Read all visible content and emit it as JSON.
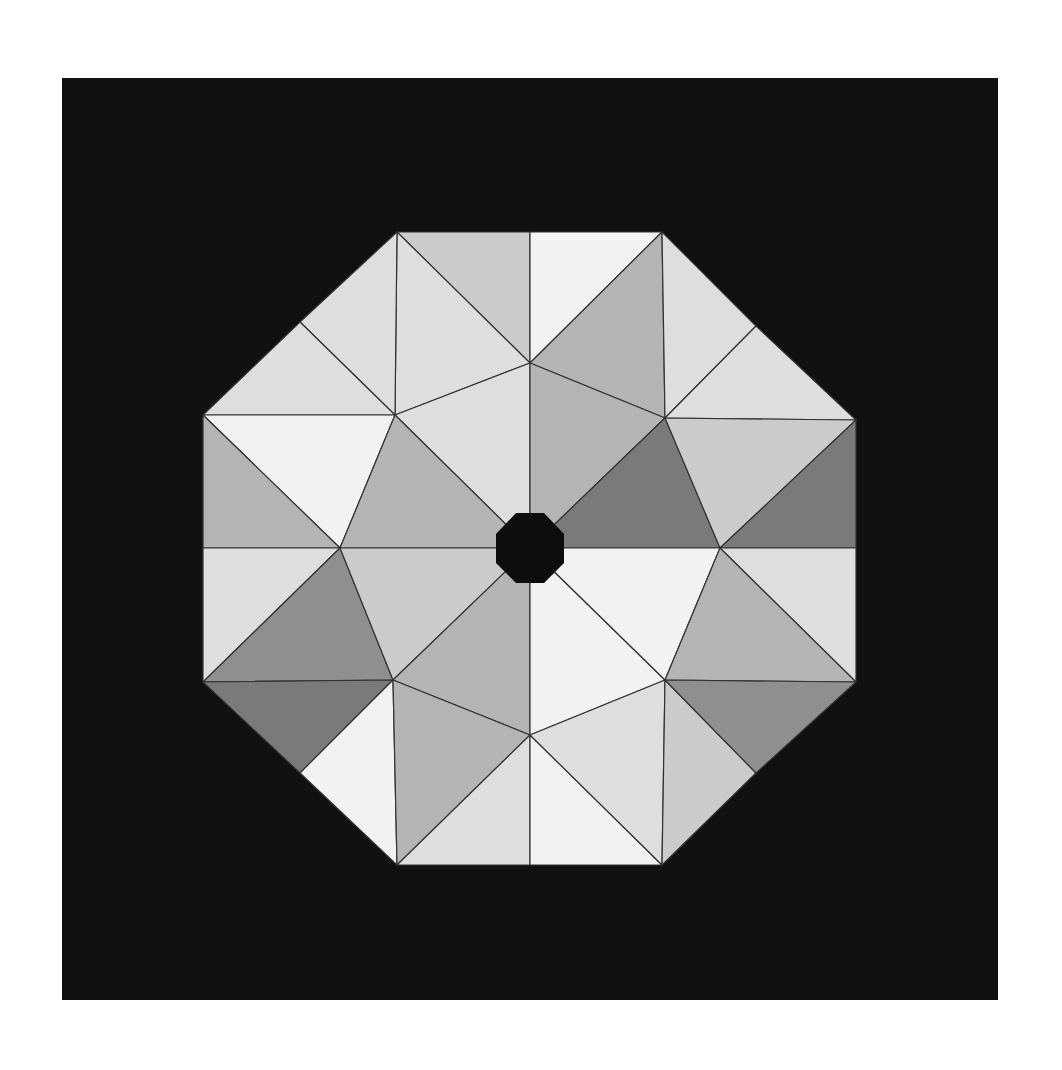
{
  "figure": {
    "title": "",
    "background": "#ffffff",
    "frame": {
      "x": 62,
      "y": 78,
      "width": 936,
      "height": 922,
      "color": "#111111"
    },
    "center": [
      530,
      548
    ],
    "center_hole": {
      "shape": "octagon",
      "color": "#0d0d0d",
      "points": [
        [
          516,
          513
        ],
        [
          544,
          513
        ],
        [
          564,
          534
        ],
        [
          564,
          563
        ],
        [
          544,
          583
        ],
        [
          516,
          583
        ],
        [
          496,
          563
        ],
        [
          496,
          534
        ]
      ]
    },
    "shades": {
      "lightest": "#f2f2f2",
      "light": "#dedede",
      "mid_light": "#cbcbcb",
      "mid": "#b4b4b4",
      "dark": "#8f8f8f",
      "darker": "#7a7a7a"
    },
    "triangles": [
      {
        "pts": [
          [
            397,
            232
          ],
          [
            530,
            232
          ],
          [
            530,
            363
          ]
        ],
        "shade": "mid_light"
      },
      {
        "pts": [
          [
            397,
            232
          ],
          [
            530,
            363
          ],
          [
            395,
            415
          ]
        ],
        "shade": "light"
      },
      {
        "pts": [
          [
            530,
            232
          ],
          [
            662,
            232
          ],
          [
            530,
            363
          ]
        ],
        "shade": "lightest"
      },
      {
        "pts": [
          [
            662,
            232
          ],
          [
            530,
            363
          ],
          [
            665,
            418
          ]
        ],
        "shade": "mid"
      },
      {
        "pts": [
          [
            662,
            232
          ],
          [
            756,
            326
          ],
          [
            665,
            418
          ]
        ],
        "shade": "light"
      },
      {
        "pts": [
          [
            756,
            326
          ],
          [
            856,
            420
          ],
          [
            665,
            418
          ]
        ],
        "shade": "light"
      },
      {
        "pts": [
          [
            397,
            232
          ],
          [
            300,
            322
          ],
          [
            395,
            415
          ]
        ],
        "shade": "light"
      },
      {
        "pts": [
          [
            300,
            322
          ],
          [
            203,
            415
          ],
          [
            395,
            415
          ]
        ],
        "shade": "light"
      },
      {
        "pts": [
          [
            203,
            415
          ],
          [
            395,
            415
          ],
          [
            340,
            548
          ]
        ],
        "shade": "lightest"
      },
      {
        "pts": [
          [
            203,
            415
          ],
          [
            340,
            548
          ],
          [
            203,
            548
          ]
        ],
        "shade": "mid"
      },
      {
        "pts": [
          [
            395,
            415
          ],
          [
            530,
            363
          ],
          [
            530,
            548
          ]
        ],
        "shade": "light"
      },
      {
        "pts": [
          [
            395,
            415
          ],
          [
            530,
            548
          ],
          [
            340,
            548
          ]
        ],
        "shade": "mid"
      },
      {
        "pts": [
          [
            530,
            363
          ],
          [
            665,
            418
          ],
          [
            530,
            548
          ]
        ],
        "shade": "mid"
      },
      {
        "pts": [
          [
            665,
            418
          ],
          [
            720,
            548
          ],
          [
            530,
            548
          ]
        ],
        "shade": "darker"
      },
      {
        "pts": [
          [
            665,
            418
          ],
          [
            856,
            420
          ],
          [
            720,
            548
          ]
        ],
        "shade": "mid_light"
      },
      {
        "pts": [
          [
            856,
            420
          ],
          [
            856,
            548
          ],
          [
            720,
            548
          ]
        ],
        "shade": "darker"
      },
      {
        "pts": [
          [
            203,
            548
          ],
          [
            340,
            548
          ],
          [
            203,
            682
          ]
        ],
        "shade": "light"
      },
      {
        "pts": [
          [
            340,
            548
          ],
          [
            393,
            680
          ],
          [
            203,
            682
          ]
        ],
        "shade": "dark"
      },
      {
        "pts": [
          [
            340,
            548
          ],
          [
            530,
            548
          ],
          [
            393,
            680
          ]
        ],
        "shade": "mid_light"
      },
      {
        "pts": [
          [
            530,
            548
          ],
          [
            530,
            735
          ],
          [
            393,
            680
          ]
        ],
        "shade": "mid"
      },
      {
        "pts": [
          [
            530,
            548
          ],
          [
            665,
            680
          ],
          [
            530,
            735
          ]
        ],
        "shade": "lightest"
      },
      {
        "pts": [
          [
            530,
            548
          ],
          [
            720,
            548
          ],
          [
            665,
            680
          ]
        ],
        "shade": "lightest"
      },
      {
        "pts": [
          [
            720,
            548
          ],
          [
            856,
            548
          ],
          [
            856,
            682
          ]
        ],
        "shade": "light"
      },
      {
        "pts": [
          [
            720,
            548
          ],
          [
            856,
            682
          ],
          [
            665,
            680
          ]
        ],
        "shade": "mid"
      },
      {
        "pts": [
          [
            203,
            682
          ],
          [
            393,
            680
          ],
          [
            300,
            773
          ]
        ],
        "shade": "darker"
      },
      {
        "pts": [
          [
            300,
            773
          ],
          [
            393,
            680
          ],
          [
            397,
            865
          ]
        ],
        "shade": "lightest"
      },
      {
        "pts": [
          [
            393,
            680
          ],
          [
            530,
            735
          ],
          [
            397,
            865
          ]
        ],
        "shade": "mid"
      },
      {
        "pts": [
          [
            397,
            865
          ],
          [
            530,
            735
          ],
          [
            530,
            865
          ]
        ],
        "shade": "light"
      },
      {
        "pts": [
          [
            530,
            735
          ],
          [
            662,
            865
          ],
          [
            530,
            865
          ]
        ],
        "shade": "lightest"
      },
      {
        "pts": [
          [
            530,
            735
          ],
          [
            665,
            680
          ],
          [
            662,
            865
          ]
        ],
        "shade": "light"
      },
      {
        "pts": [
          [
            665,
            680
          ],
          [
            756,
            773
          ],
          [
            662,
            865
          ]
        ],
        "shade": "mid_light"
      },
      {
        "pts": [
          [
            665,
            680
          ],
          [
            856,
            682
          ],
          [
            756,
            773
          ]
        ],
        "shade": "dark"
      }
    ]
  }
}
